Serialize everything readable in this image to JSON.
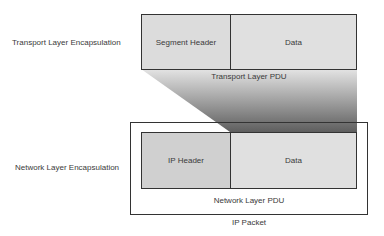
{
  "diagram": {
    "title": "",
    "transport": {
      "side_label": "Transport Layer Encapsulation",
      "header_label": "Segment Header",
      "data_label": "Data",
      "pdu_label": "Transport Layer PDU"
    },
    "network": {
      "side_label": "Network Layer Encapsulation",
      "header_label": "IP Header",
      "data_label": "Data",
      "pdu_label": "Network Layer PDU",
      "packet_label": "IP Packet"
    },
    "colors": {
      "border": "#333333",
      "header_fill": "#d0d0d0",
      "data_fill": "#e0e0e0",
      "segment_header_fill": "#dcdcdc",
      "wedge_light": "#d8d8d8",
      "wedge_dark": "#6a6a6a"
    }
  }
}
